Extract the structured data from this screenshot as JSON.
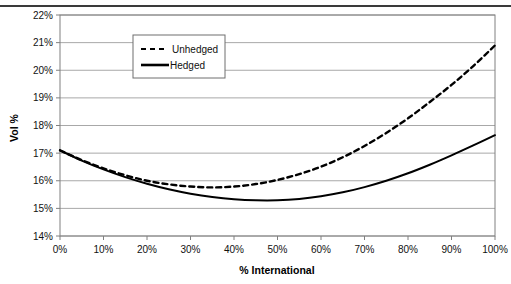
{
  "figure": {
    "top_rule": true,
    "background_color": "#ffffff",
    "series_color": "#000000",
    "gridline_color": "#a8a8a8",
    "axis_color": "#808080"
  },
  "legend": {
    "position": "upper-center-left",
    "items": [
      {
        "label": "Unhedged",
        "style": "dashed"
      },
      {
        "label": "Hedged",
        "style": "solid"
      }
    ]
  },
  "chart_data": {
    "type": "line",
    "title": "",
    "xlabel": "% International",
    "ylabel": "Vol %",
    "xlim": [
      0,
      100
    ],
    "ylim": [
      14,
      22
    ],
    "grid": true,
    "x_tick_labels": [
      "0%",
      "10%",
      "20%",
      "30%",
      "40%",
      "50%",
      "60%",
      "70%",
      "80%",
      "90%",
      "100%"
    ],
    "y_tick_labels": [
      "14%",
      "15%",
      "16%",
      "17%",
      "18%",
      "19%",
      "20%",
      "21%",
      "22%"
    ],
    "x_ticks": [
      0,
      10,
      20,
      30,
      40,
      50,
      60,
      70,
      80,
      90,
      100
    ],
    "y_ticks": [
      14,
      15,
      16,
      17,
      18,
      19,
      20,
      21,
      22
    ],
    "x": [
      0,
      5,
      10,
      15,
      20,
      25,
      30,
      35,
      40,
      45,
      50,
      55,
      60,
      65,
      70,
      75,
      80,
      85,
      90,
      95,
      100
    ],
    "series": [
      {
        "name": "Unhedged",
        "style": "dashed",
        "values": [
          17.1,
          16.75,
          16.45,
          16.2,
          16.0,
          15.87,
          15.79,
          15.76,
          15.79,
          15.88,
          16.03,
          16.24,
          16.51,
          16.85,
          17.26,
          17.73,
          18.26,
          18.85,
          19.47,
          20.15,
          20.9
        ]
      },
      {
        "name": "Hedged",
        "style": "solid",
        "values": [
          17.1,
          16.73,
          16.41,
          16.13,
          15.89,
          15.69,
          15.53,
          15.41,
          15.33,
          15.29,
          15.29,
          15.34,
          15.44,
          15.58,
          15.77,
          16.0,
          16.27,
          16.58,
          16.92,
          17.28,
          17.65
        ]
      }
    ],
    "legend_position": "upper-left"
  }
}
